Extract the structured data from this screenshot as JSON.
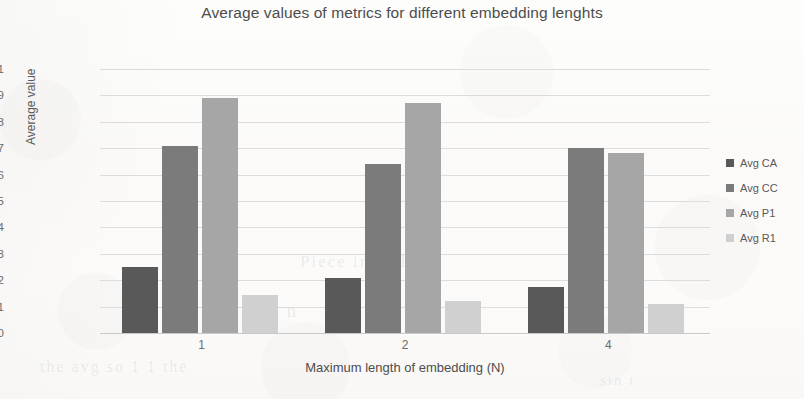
{
  "chart_data": {
    "type": "bar",
    "title": "Average values of metrics for different embedding lenghts",
    "xlabel": "Maximum length of embedding (N)",
    "ylabel": "Average value",
    "categories": [
      "1",
      "2",
      "4"
    ],
    "ylim": [
      0,
      1
    ],
    "ytick_labels": [
      "0",
      "0,1",
      "0,2",
      "0,3",
      "0,4",
      "0,5",
      "0,6",
      "0,7",
      "0,8",
      "0,9",
      "1"
    ],
    "ytick_values": [
      0,
      0.1,
      0.2,
      0.3,
      0.4,
      0.5,
      0.6,
      0.7,
      0.8,
      0.9,
      1
    ],
    "grid": true,
    "legend_position": "right",
    "series": [
      {
        "name": "Avg CA",
        "color": "#595959",
        "values": [
          0.25,
          0.21,
          0.175
        ]
      },
      {
        "name": "Avg CC",
        "color": "#7b7b7b",
        "values": [
          0.71,
          0.64,
          0.7
        ]
      },
      {
        "name": "Avg P1",
        "color": "#a6a6a6",
        "values": [
          0.89,
          0.87,
          0.68
        ]
      },
      {
        "name": "Avg R1",
        "color": "#d0d0d0",
        "values": [
          0.145,
          0.12,
          0.11
        ]
      }
    ]
  },
  "page": {
    "background_color": "#fbfaf8",
    "grid_color": "#dcdcdc",
    "text_color": "#595959",
    "bleed_text": [
      "Piece in and",
      "C I n",
      "the avg so 1 1 the",
      "sin t"
    ]
  }
}
